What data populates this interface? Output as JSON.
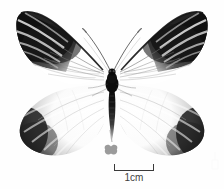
{
  "figure": {
    "background_color": "#fefefe",
    "specimen": {
      "name": "pinned-butterfly-specimen",
      "description": "Dorsal view of a white pierid butterfly with black apical forewing markings and dark striated hindwing margins",
      "wing_color": "#ffffff",
      "marking_color": "#111111",
      "body_color": "#0d0d0d"
    },
    "mini_icon": {
      "name": "butterfly-icon",
      "color": "#9b9b9b"
    },
    "scale_bar": {
      "label": "1cm",
      "tick_color": "#3a3a3a",
      "label_color": "#3f3f3f"
    },
    "watermark": {
      "name": "corner-watermark",
      "color": "#f4f4f4"
    }
  }
}
